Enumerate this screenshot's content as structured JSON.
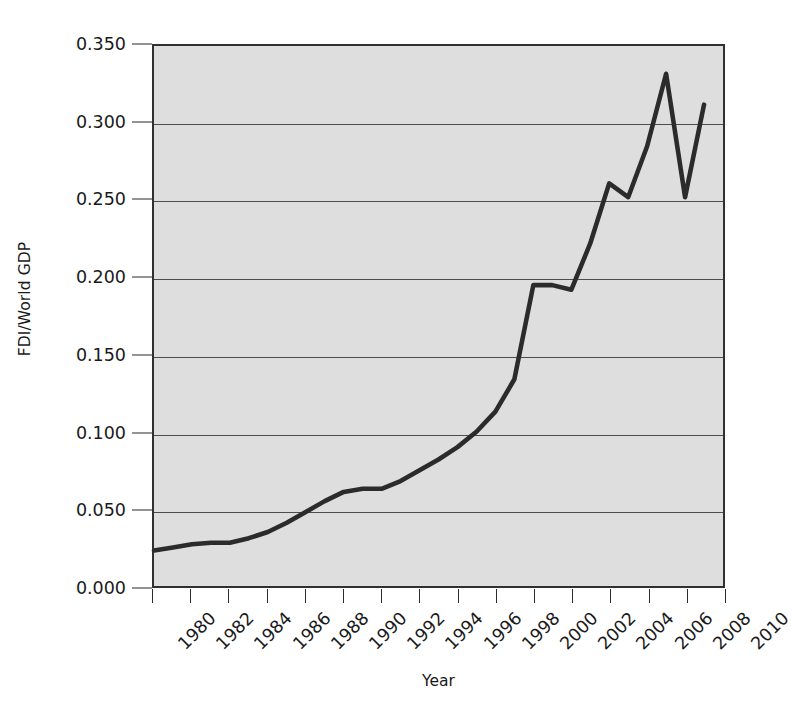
{
  "chart_data": {
    "type": "line",
    "title": "",
    "xlabel": "Year",
    "ylabel": "FDI/World GDP",
    "xlim": [
      1980,
      2010
    ],
    "ylim": [
      0.0,
      0.35
    ],
    "grid": true,
    "legend_position": "none",
    "ytick_labels": [
      "0.000",
      "0.050",
      "0.100",
      "0.150",
      "0.200",
      "0.250",
      "0.300",
      "0.350"
    ],
    "ytick_values": [
      0.0,
      0.05,
      0.1,
      0.15,
      0.2,
      0.25,
      0.3,
      0.35
    ],
    "xtick_labels": [
      "1980",
      "1982",
      "1984",
      "1986",
      "1988",
      "1990",
      "1992",
      "1994",
      "1996",
      "1998",
      "2000",
      "2002",
      "2004",
      "2006",
      "2008",
      "2010"
    ],
    "xtick_values": [
      1980,
      1982,
      1984,
      1986,
      1988,
      1990,
      1992,
      1994,
      1996,
      1998,
      2000,
      2002,
      2004,
      2006,
      2008,
      2010
    ],
    "series": [
      {
        "name": "FDI/World GDP",
        "color": "#2b2b2b",
        "x": [
          1980,
          1981,
          1982,
          1983,
          1984,
          1985,
          1986,
          1987,
          1988,
          1989,
          1990,
          1991,
          1992,
          1993,
          1994,
          1995,
          1996,
          1997,
          1998,
          1999,
          2000,
          2001,
          2002,
          2003,
          2004,
          2005,
          2006,
          2007,
          2008,
          2009
        ],
        "values": [
          0.023,
          0.025,
          0.027,
          0.028,
          0.028,
          0.031,
          0.035,
          0.041,
          0.048,
          0.055,
          0.061,
          0.063,
          0.063,
          0.068,
          0.075,
          0.082,
          0.09,
          0.1,
          0.113,
          0.134,
          0.195,
          0.195,
          0.192,
          0.222,
          0.261,
          0.252,
          0.285,
          0.332,
          0.252,
          0.312
        ]
      }
    ]
  },
  "axes": {
    "ylabel_text": "FDI/World GDP",
    "xlabel_text": "Year"
  },
  "colors": {
    "plot_background": "#dedede",
    "frame": "#303030",
    "gridline": "#4c4c4c",
    "series_line": "#2b2b2b",
    "page_background": "#ffffff"
  }
}
